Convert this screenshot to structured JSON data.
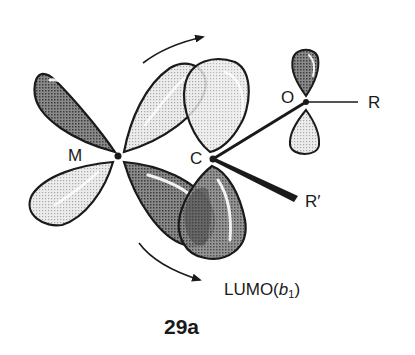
{
  "figure": {
    "number_label": "29a",
    "caption_orbital": {
      "prefix": "LUMO(",
      "symbol": "b",
      "subscript": "1",
      "suffix": ")"
    },
    "atoms": {
      "metal": "M",
      "carbon": "C",
      "oxygen": "O",
      "substituent_r": "R",
      "substituent_r_prime": "R′"
    },
    "colors": {
      "outline": "#1a1a1a",
      "dark_lobe": "#6e6e6e",
      "light_lobe": "#d6d6d6",
      "overlap": "#4a4a4a"
    },
    "elements": [
      "metal d-orbital (four lobes, alternating phase)",
      "carbene p-orbital LUMO(b1) (two lobes, rotated)",
      "oxygen p-orbital (two lobes)",
      "rotation arrows (upper and lower)",
      "bonds C–O, C–R′, O–R"
    ]
  }
}
